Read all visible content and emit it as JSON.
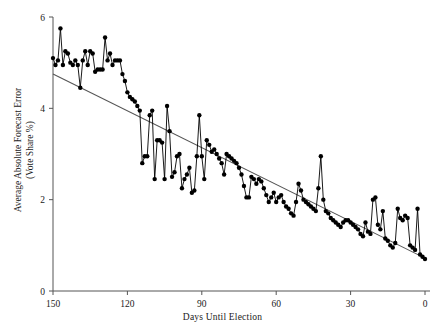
{
  "chart_data": {
    "type": "line",
    "title": "",
    "xlabel": "Days Until Election",
    "ylabel_line1": "Average Absolute Forecast Error",
    "ylabel_line2": "(Vote Share %)",
    "xlim": [
      150,
      0
    ],
    "ylim": [
      0,
      6
    ],
    "x_ticks": [
      150,
      120,
      90,
      60,
      30,
      0
    ],
    "y_ticks": [
      0,
      2,
      4,
      6
    ],
    "grid": false,
    "legend": null,
    "x_axis_reversed": true,
    "marker": "filled-circle",
    "series": [
      {
        "name": "Average Absolute Forecast Error",
        "color": "#000000",
        "x": [
          150,
          149,
          148,
          147,
          146,
          145,
          144,
          143,
          142,
          141,
          140,
          139,
          138,
          137,
          136,
          135,
          134,
          133,
          132,
          131,
          130,
          129,
          128,
          127,
          126,
          125,
          124,
          123,
          122,
          121,
          120,
          119,
          118,
          117,
          116,
          115,
          114,
          113,
          112,
          111,
          110,
          109,
          108,
          107,
          106,
          105,
          104,
          103,
          102,
          101,
          100,
          99,
          98,
          97,
          96,
          95,
          94,
          93,
          92,
          91,
          90,
          89,
          88,
          87,
          86,
          85,
          84,
          83,
          82,
          81,
          80,
          79,
          78,
          77,
          76,
          75,
          74,
          73,
          72,
          71,
          70,
          69,
          68,
          67,
          66,
          65,
          64,
          63,
          62,
          61,
          60,
          59,
          58,
          57,
          56,
          55,
          54,
          53,
          52,
          51,
          50,
          49,
          48,
          47,
          46,
          45,
          44,
          43,
          42,
          41,
          40,
          39,
          38,
          37,
          36,
          35,
          34,
          33,
          32,
          31,
          30,
          29,
          28,
          27,
          26,
          25,
          24,
          23,
          22,
          21,
          20,
          19,
          18,
          17,
          16,
          15,
          14,
          13,
          12,
          11,
          10,
          9,
          8,
          7,
          6,
          5,
          4,
          3,
          2,
          1,
          0
        ],
        "y": [
          5.1,
          4.95,
          5.05,
          5.75,
          4.95,
          5.25,
          5.2,
          5.0,
          4.95,
          5.05,
          4.95,
          4.45,
          5.05,
          5.25,
          4.95,
          5.25,
          5.2,
          4.8,
          4.85,
          4.85,
          4.85,
          5.55,
          5.05,
          5.2,
          4.95,
          5.05,
          5.05,
          5.05,
          4.75,
          4.6,
          4.35,
          4.25,
          4.2,
          4.15,
          4.05,
          3.95,
          2.8,
          2.95,
          2.95,
          3.85,
          3.95,
          2.45,
          3.3,
          3.3,
          3.25,
          2.45,
          4.05,
          3.5,
          2.5,
          2.6,
          2.95,
          3.0,
          2.25,
          2.45,
          2.55,
          2.7,
          2.15,
          2.2,
          2.95,
          3.85,
          2.95,
          2.45,
          3.3,
          3.2,
          3.05,
          3.1,
          3.0,
          2.9,
          2.8,
          2.55,
          3.0,
          2.95,
          2.9,
          2.85,
          2.8,
          2.7,
          2.55,
          2.3,
          2.05,
          2.05,
          2.5,
          2.45,
          2.35,
          2.45,
          2.4,
          2.25,
          2.1,
          1.95,
          2.05,
          2.15,
          1.95,
          2.05,
          2.1,
          1.95,
          1.85,
          1.8,
          1.7,
          1.65,
          1.95,
          2.35,
          2.2,
          2.0,
          1.95,
          1.9,
          1.85,
          1.8,
          1.75,
          2.25,
          2.95,
          2.0,
          1.75,
          1.7,
          1.6,
          1.55,
          1.5,
          1.45,
          1.4,
          1.5,
          1.55,
          1.55,
          1.5,
          1.45,
          1.4,
          1.35,
          1.25,
          1.2,
          1.5,
          1.3,
          1.25,
          2.0,
          2.05,
          1.45,
          1.35,
          1.75,
          1.15,
          1.1,
          1.0,
          0.95,
          1.05,
          1.8,
          1.6,
          1.55,
          1.65,
          1.6,
          1.0,
          0.95,
          0.9,
          1.8,
          0.8,
          0.75,
          0.7
        ]
      }
    ],
    "trend_line": {
      "name": "linear-fit",
      "color": "#555555",
      "x_start": 150,
      "y_start": 4.75,
      "x_end": 0,
      "y_end": 0.72
    }
  }
}
